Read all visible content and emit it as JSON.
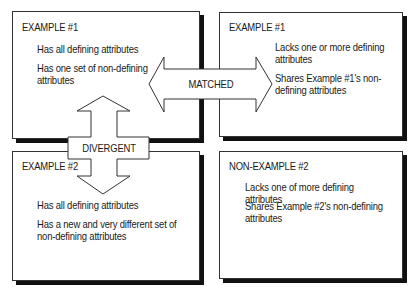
{
  "diagram": {
    "boxes": {
      "top_left": {
        "title": "EXAMPLE #1",
        "attributes": [
          "Has all defining attributes",
          "Has one set of non-defining attributes"
        ],
        "attr_lines": [
          [
            "Has all defining attributes"
          ],
          [
            "Has one set of non-defining",
            "attributes"
          ]
        ]
      },
      "top_right": {
        "title": "EXAMPLE #1",
        "attributes": [
          "Lacks one or more defining attributes",
          "Shares Example #1's non-defining attributes"
        ],
        "attr_lines": [
          [
            "Lacks one or more defining",
            "attributes"
          ],
          [
            "Shares Example #1's non-",
            "defining attributes"
          ]
        ]
      },
      "bottom_left": {
        "title": "EXAMPLE #2",
        "attributes": [
          "Has all defining attributes",
          "Has a new and very different set of non-defining attributes"
        ],
        "attr_lines": [
          [
            "Has all defining attributes"
          ],
          [
            "Has a new and very different set of",
            "non-defining attributes"
          ]
        ]
      },
      "bottom_right": {
        "title": "NON-EXAMPLE #2",
        "attributes": [
          "Lacks one of more defining attributes",
          "Shares Example #2's non-defining attributes"
        ],
        "attr_lines": [
          [
            "Lacks one of more defining attributes"
          ],
          [
            "Shares Example #2's non-defining",
            "attributes"
          ]
        ]
      }
    },
    "arrows": {
      "horizontal": {
        "label": "MATCHED",
        "direction": "double-horizontal"
      },
      "vertical": {
        "label": "DIVERGENT",
        "direction": "double-vertical"
      }
    },
    "colors": {
      "border": "#333333",
      "shadow": "#111111",
      "text": "#1a1a1a",
      "background": "#ffffff"
    }
  }
}
